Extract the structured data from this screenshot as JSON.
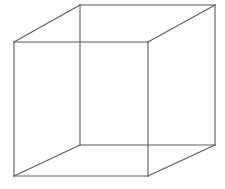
{
  "figure": {
    "name": "necker-cube",
    "background_color": "#ffffff",
    "stroke_color": "#5a5a5a",
    "stroke_width": 1.1,
    "canvas": {
      "width": 225,
      "height": 189
    },
    "vertices": {
      "back_top_left": {
        "x": 14,
        "y": 42
      },
      "back_top_right": {
        "x": 148,
        "y": 42
      },
      "back_bottom_right": {
        "x": 148,
        "y": 176
      },
      "back_bottom_left": {
        "x": 14,
        "y": 176
      },
      "front_top_left": {
        "x": 80,
        "y": 5
      },
      "front_top_right": {
        "x": 215,
        "y": 5
      },
      "front_bottom_right": {
        "x": 215,
        "y": 145
      },
      "front_bottom_left": {
        "x": 80,
        "y": 145
      }
    },
    "edges": [
      {
        "name": "back-top-edge",
        "from": "back_top_left",
        "to": "back_top_right"
      },
      {
        "name": "back-right-edge",
        "from": "back_top_right",
        "to": "back_bottom_right"
      },
      {
        "name": "back-bottom-edge",
        "from": "back_bottom_right",
        "to": "back_bottom_left"
      },
      {
        "name": "back-left-edge",
        "from": "back_bottom_left",
        "to": "back_top_left"
      },
      {
        "name": "front-top-edge",
        "from": "front_top_left",
        "to": "front_top_right"
      },
      {
        "name": "front-right-edge",
        "from": "front_top_right",
        "to": "front_bottom_right"
      },
      {
        "name": "front-bottom-edge",
        "from": "front_bottom_right",
        "to": "front_bottom_left"
      },
      {
        "name": "front-left-edge",
        "from": "front_bottom_left",
        "to": "front_top_left"
      },
      {
        "name": "connector-top-left",
        "from": "back_top_left",
        "to": "front_top_left"
      },
      {
        "name": "connector-top-right",
        "from": "back_top_right",
        "to": "front_top_right"
      },
      {
        "name": "connector-bottom-right",
        "from": "back_bottom_right",
        "to": "front_bottom_right"
      },
      {
        "name": "connector-bottom-left",
        "from": "back_bottom_left",
        "to": "front_bottom_left"
      }
    ]
  }
}
